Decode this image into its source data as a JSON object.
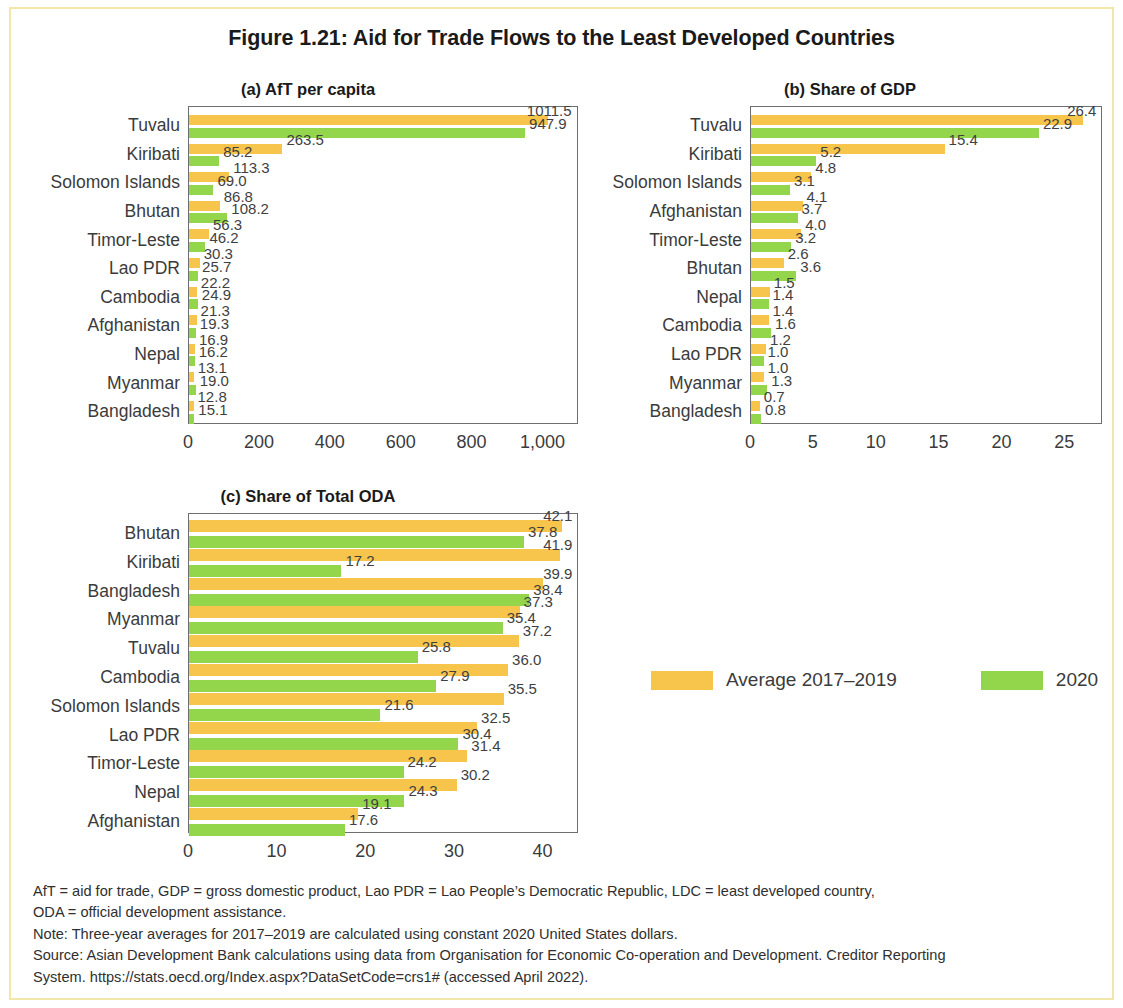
{
  "figure": {
    "title": "Figure 1.21: Aid for Trade Flows to the Least Developed Countries"
  },
  "legend": {
    "items": [
      {
        "label": "Average 2017–2019",
        "color": "#f7c44c",
        "key": "avg"
      },
      {
        "label": "2020",
        "color": "#93d64c",
        "key": "y2020"
      }
    ]
  },
  "notes": [
    "AfT = aid for trade, GDP = gross domestic product, Lao PDR = Lao People’s Democratic Republic, LDC = least developed country,",
    "ODA = official development assistance.",
    "Note: Three-year averages for 2017–2019 are calculated using constant 2020 United States dollars.",
    "Source: Asian Development Bank calculations using data from Organisation for Economic Co-operation and Development. Creditor Reporting",
    "System. https://stats.oecd.org/Index.aspx?DataSetCode=crs1# (accessed April 2022)."
  ],
  "chart_data": [
    {
      "id": "a",
      "type": "bar",
      "orientation": "horizontal",
      "title": "(a) AfT per capita",
      "xlabel": "",
      "ylabel": "",
      "xlim": [
        0,
        1100
      ],
      "xticks": [
        0,
        200,
        400,
        600,
        800,
        1000
      ],
      "xticklabels": [
        "0",
        "200",
        "400",
        "600",
        "800",
        "1,000"
      ],
      "grid": false,
      "legend_position": "external",
      "categories": [
        "Tuvalu",
        "Kiribati",
        "Solomon Islands",
        "Bhutan",
        "Timor-Leste",
        "Lao PDR",
        "Cambodia",
        "Afghanistan",
        "Nepal",
        "Myanmar",
        "Bangladesh"
      ],
      "series": [
        {
          "name": "Average 2017–2019",
          "values": [
            1011.5,
            263.5,
            113.3,
            86.8,
            56.3,
            30.3,
            22.2,
            21.3,
            16.9,
            13.1,
            12.8
          ]
        },
        {
          "name": "2020",
          "values": [
            947.9,
            85.2,
            69.0,
            108.2,
            46.2,
            25.7,
            24.9,
            19.3,
            16.2,
            19.0,
            15.1
          ]
        }
      ],
      "labels": {
        "avg": [
          "1011.5",
          "263.5",
          "113.3",
          "86.8",
          "56.3",
          "30.3",
          "22.2",
          "21.3",
          "16.9",
          "13.1",
          "12.8"
        ],
        "y2020": [
          "947.9",
          "85.2",
          "69.0",
          "108.2",
          "46.2",
          "25.7",
          "24.9",
          "19.3",
          "16.2",
          "19.0",
          "15.1"
        ]
      }
    },
    {
      "id": "b",
      "type": "bar",
      "orientation": "horizontal",
      "title": "(b) Share of GDP",
      "xlabel": "",
      "ylabel": "",
      "xlim": [
        0,
        28
      ],
      "xticks": [
        0,
        5,
        10,
        15,
        20,
        25
      ],
      "xticklabels": [
        "0",
        "5",
        "10",
        "15",
        "20",
        "25"
      ],
      "grid": false,
      "legend_position": "external",
      "categories": [
        "Tuvalu",
        "Kiribati",
        "Solomon Islands",
        "Afghanistan",
        "Timor-Leste",
        "Bhutan",
        "Nepal",
        "Cambodia",
        "Lao PDR",
        "Myanmar",
        "Bangladesh"
      ],
      "series": [
        {
          "name": "Average 2017–2019",
          "values": [
            26.4,
            15.4,
            4.8,
            4.1,
            4.0,
            2.6,
            1.5,
            1.4,
            1.2,
            1.0,
            0.7
          ]
        },
        {
          "name": "2020",
          "values": [
            22.9,
            5.2,
            3.1,
            3.7,
            3.2,
            3.6,
            1.4,
            1.6,
            1.0,
            1.3,
            0.8
          ]
        }
      ],
      "labels": {
        "avg": [
          "26.4",
          "15.4",
          "4.8",
          "4.1",
          "4.0",
          "2.6",
          "1.5",
          "1.4",
          "1.2",
          "1.0",
          "0.7"
        ],
        "y2020": [
          "22.9",
          "5.2",
          "3.1",
          "3.7",
          "3.2",
          "3.6",
          "1.4",
          "1.6",
          "1.0",
          "1.3",
          "0.8"
        ]
      }
    },
    {
      "id": "c",
      "type": "bar",
      "orientation": "horizontal",
      "title": "(c) Share of Total ODA",
      "xlabel": "",
      "ylabel": "",
      "xlim": [
        0,
        44
      ],
      "xticks": [
        0,
        10,
        20,
        30,
        40
      ],
      "xticklabels": [
        "0",
        "10",
        "20",
        "30",
        "40"
      ],
      "grid": false,
      "legend_position": "external",
      "categories": [
        "Bhutan",
        "Kiribati",
        "Bangladesh",
        "Myanmar",
        "Tuvalu",
        "Cambodia",
        "Solomon Islands",
        "Lao PDR",
        "Timor-Leste",
        "Nepal",
        "Afghanistan"
      ],
      "series": [
        {
          "name": "Average 2017–2019",
          "values": [
            42.1,
            41.9,
            39.9,
            37.3,
            37.2,
            36.0,
            35.5,
            32.5,
            31.4,
            30.2,
            19.1
          ]
        },
        {
          "name": "2020",
          "values": [
            37.8,
            17.2,
            38.4,
            35.4,
            25.8,
            27.9,
            21.6,
            30.4,
            24.2,
            24.3,
            17.6
          ]
        }
      ],
      "labels": {
        "avg": [
          "42.1",
          "41.9",
          "39.9",
          "37.3",
          "37.2",
          "36.0",
          "35.5",
          "32.5",
          "31.4",
          "30.2",
          "19.1"
        ],
        "y2020": [
          "37.8",
          "17.2",
          "38.4",
          "35.4",
          "25.8",
          "27.9",
          "21.6",
          "30.4",
          "24.2",
          "24.3",
          "17.6"
        ]
      }
    }
  ]
}
